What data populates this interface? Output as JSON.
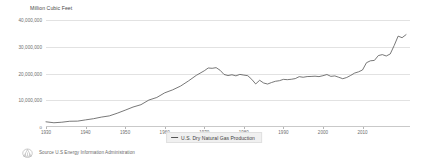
{
  "chart_data": {
    "type": "line",
    "title": "",
    "ylabel": "Million Cubic Feet",
    "xlabel": "",
    "ylim": [
      0,
      40000000
    ],
    "xlim": [
      1930,
      2022
    ],
    "grid": true,
    "legend_position": "bottom-center",
    "y_ticks": [
      {
        "value": 40000000,
        "label": "40,000,000"
      },
      {
        "value": 30000000,
        "label": "30,000,000"
      },
      {
        "value": 20000000,
        "label": "20,000,000"
      },
      {
        "value": 10000000,
        "label": "10,000,000"
      },
      {
        "value": 0,
        "label": "0"
      }
    ],
    "x_ticks": [
      {
        "value": 1930,
        "label": "1930"
      },
      {
        "value": 1940,
        "label": "1940"
      },
      {
        "value": 1950,
        "label": "1950"
      },
      {
        "value": 1960,
        "label": "1960"
      },
      {
        "value": 1970,
        "label": "1970"
      },
      {
        "value": 1980,
        "label": "1980"
      },
      {
        "value": 1990,
        "label": "1990"
      },
      {
        "value": 2000,
        "label": "2000"
      },
      {
        "value": 2010,
        "label": "2010"
      }
    ],
    "series": [
      {
        "name": "U.S. Dry Natural Gas Production",
        "color": "#555555",
        "x": [
          1930,
          1932,
          1934,
          1936,
          1938,
          1940,
          1942,
          1944,
          1946,
          1948,
          1950,
          1952,
          1954,
          1956,
          1958,
          1960,
          1962,
          1964,
          1966,
          1968,
          1970,
          1971,
          1972,
          1973,
          1974,
          1975,
          1976,
          1977,
          1978,
          1979,
          1980,
          1981,
          1982,
          1983,
          1984,
          1985,
          1986,
          1987,
          1988,
          1989,
          1990,
          1991,
          1992,
          1993,
          1994,
          1995,
          1996,
          1997,
          1998,
          1999,
          2000,
          2001,
          2002,
          2003,
          2004,
          2005,
          2006,
          2007,
          2008,
          2009,
          2010,
          2011,
          2012,
          2013,
          2014,
          2015,
          2016,
          2017,
          2018,
          2019,
          2020,
          2021
        ],
        "values": [
          1940000,
          1590000,
          1790000,
          2150000,
          2200000,
          2660000,
          3100000,
          3700000,
          4150000,
          5150000,
          6280000,
          7460000,
          8340000,
          10080000,
          11030000,
          12770000,
          13880000,
          15290000,
          17210000,
          19320000,
          21014000,
          22060000,
          21940000,
          22187000,
          21210000,
          19640000,
          19236000,
          19521000,
          19122000,
          19663000,
          19403000,
          19181000,
          17820000,
          16090000,
          17466000,
          16454000,
          16059000,
          16621000,
          17103000,
          17311000,
          17810000,
          17698000,
          17840000,
          18095000,
          18821000,
          18599000,
          18854000,
          18902000,
          18989000,
          18832000,
          19182000,
          19616000,
          18928000,
          19099000,
          18591000,
          18051000,
          18504000,
          19266000,
          20159000,
          20624000,
          21316000,
          24033000,
          24746000,
          24894000,
          26702000,
          27062000,
          26546000,
          27302000,
          30443000,
          33973000,
          33387000,
          34518000
        ],
        "units": "Million Cubic Feet"
      }
    ]
  },
  "legend": {
    "entries": [
      {
        "label": "U.S. Dry Natural Gas Production",
        "color": "#555555",
        "marker": "line-marker"
      }
    ]
  },
  "footer": {
    "logo_name": "eia-circular-logo",
    "source_text": "Source U.S Energy Information Administration"
  },
  "colors": {
    "background": "#ffffff",
    "gridline": "#e2e2e2",
    "baseline": "#c9c9c9",
    "series_line": "#555555",
    "tick_text": "#6d6d6d",
    "legend_background": "#f0f0f0"
  }
}
